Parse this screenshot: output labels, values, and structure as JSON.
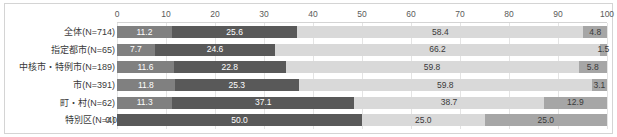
{
  "chart_data": {
    "type": "bar",
    "subtype": "stacked-horizontal-100pct",
    "title": "",
    "xlabel": "",
    "ylabel": "",
    "xlim": [
      0,
      100
    ],
    "xticks": [
      0,
      10,
      20,
      30,
      40,
      50,
      60,
      70,
      80,
      90,
      100
    ],
    "xtick_labels": [
      "0",
      "10",
      "20",
      "30",
      "40",
      "50",
      "60",
      "70",
      "80",
      "90",
      "100"
    ],
    "grid": true,
    "grid_axis": "x",
    "legend": false,
    "legend_position": "none",
    "orientation": "horizontal",
    "categories": [
      "全体(N=714)",
      "指定都市(N=65)",
      "中核市・特例市(N=189)",
      "市(N=391)",
      "町・村(N=62)",
      "特別区(N=4)"
    ],
    "series": [
      {
        "name": "series-1",
        "color": "#808080",
        "values": [
          11.2,
          7.7,
          11.6,
          11.8,
          11.3,
          0.0
        ],
        "labels": [
          "11.2",
          "7.7",
          "11.6",
          "11.8",
          "11.3",
          "0.0"
        ]
      },
      {
        "name": "series-2",
        "color": "#595959",
        "values": [
          25.6,
          24.6,
          22.8,
          25.3,
          37.1,
          50.0
        ],
        "labels": [
          "25.6",
          "24.6",
          "22.8",
          "25.3",
          "37.1",
          "50.0"
        ]
      },
      {
        "name": "series-3",
        "color": "#d9d9d9",
        "values": [
          58.4,
          66.2,
          59.8,
          59.8,
          38.7,
          25.0
        ],
        "labels": [
          "58.4",
          "66.2",
          "59.8",
          "59.8",
          "38.7",
          "25.0"
        ]
      },
      {
        "name": "series-4",
        "color": "#a6a6a6",
        "values": [
          4.8,
          1.5,
          5.8,
          3.1,
          12.9,
          25.0
        ],
        "labels": [
          "4.8",
          "1.5",
          "5.8",
          "3.1",
          "12.9",
          "25.0"
        ]
      }
    ],
    "row_totals": [
      100.0,
      100.0,
      100.0,
      100.0,
      100.0,
      100.0
    ]
  },
  "colors": {
    "plot_background": "#ffffff",
    "border": "#d4d4d4",
    "gridline": "#e4e4e4",
    "tick_label": "#5a5a5a",
    "category_label": "#3a3a3a",
    "label_on_dark": "#ffffff",
    "label_on_light": "#3a3a3a"
  }
}
